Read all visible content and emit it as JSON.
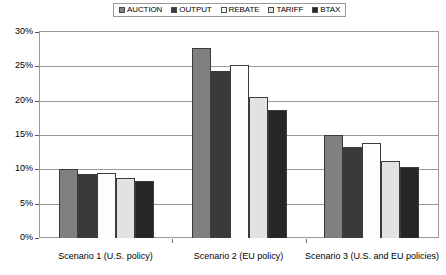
{
  "chart_data": {
    "type": "bar",
    "title": "",
    "xlabel": "",
    "ylabel": "",
    "ylim": [
      0,
      30
    ],
    "ytick_labels": [
      "0%",
      "5%",
      "10%",
      "15%",
      "20%",
      "25%",
      "30%"
    ],
    "ytick_values": [
      0,
      5,
      10,
      15,
      20,
      25,
      30
    ],
    "grid": true,
    "legend_position": "top-center",
    "categories": [
      "Scenario 1 (U.S. policy)",
      "Scenario 2 (EU policy)",
      "Scenario 3 (U.S. and EU policies)"
    ],
    "series": [
      {
        "name": "AUCTION",
        "color": "#808080",
        "values": [
          10.0,
          27.7,
          15.0
        ]
      },
      {
        "name": "OUTPUT",
        "color": "#3a3a3a",
        "values": [
          9.3,
          24.3,
          13.3
        ]
      },
      {
        "name": "REBATE",
        "color": "#fdfdfd",
        "values": [
          9.4,
          25.2,
          13.8
        ]
      },
      {
        "name": "TARIFF",
        "color": "#e2e2e2",
        "values": [
          8.8,
          20.6,
          11.2
        ]
      },
      {
        "name": "BTAX",
        "color": "#262626",
        "values": [
          8.3,
          18.7,
          10.3
        ]
      }
    ]
  },
  "legend": {
    "items": [
      {
        "label": "AUCTION",
        "color": "#808080"
      },
      {
        "label": "OUTPUT",
        "color": "#3a3a3a"
      },
      {
        "label": "REBATE",
        "color": "#fdfdfd"
      },
      {
        "label": "TARIFF",
        "color": "#e2e2e2"
      },
      {
        "label": "BTAX",
        "color": "#262626"
      }
    ]
  }
}
